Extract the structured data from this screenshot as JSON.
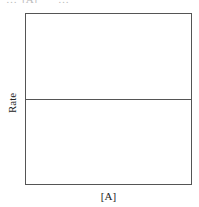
{
  "chart_data": {
    "type": "line",
    "title": "",
    "xlabel": "[A]",
    "ylabel": "Rate",
    "x_ticks": [],
    "y_ticks": [],
    "grid": false,
    "legend": null,
    "series": [
      {
        "name": "rate vs [A]",
        "x": [
          0,
          1
        ],
        "y": [
          0.5,
          0.5
        ],
        "description": "horizontal line: rate constant, independent of [A] (zero order)"
      }
    ],
    "xlim": [
      0,
      1
    ],
    "ylim": [
      0,
      1
    ],
    "line_y_fraction": 0.5
  },
  "cropped_header": {
    "fragment_left": "…",
    "fragment_mid": "[A]",
    "fragment_right": "…"
  }
}
